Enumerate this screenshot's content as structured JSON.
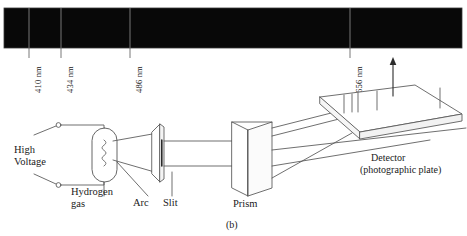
{
  "figure": {
    "id": "(b)"
  },
  "spectrum": {
    "name": "hydrogen-emission-spectrum",
    "background_color": "#080808",
    "line_color": "#6e6e6e",
    "box": {
      "x": 4,
      "y": 8,
      "width": 458,
      "height": 40
    },
    "lines": [
      {
        "label": "410 nm",
        "wavelength_nm": 410,
        "x": 29
      },
      {
        "label": "434 nm",
        "wavelength_nm": 434,
        "x": 61
      },
      {
        "label": "486 nm",
        "wavelength_nm": 486,
        "x": 130
      },
      {
        "label": "656 nm",
        "wavelength_nm": 656,
        "x": 350
      }
    ]
  },
  "apparatus": {
    "name": "spectrometer-diagram",
    "parts": {
      "high_voltage": "High\nVoltage",
      "hydrogen_gas": "Hydrogen\ngas",
      "arc": "Arc",
      "slit": "Slit",
      "prism": "Prism",
      "detector_line1": "Detector",
      "detector_line2": "(photographic plate)"
    }
  },
  "colors": {
    "ink": "#1a1a1a",
    "stroke": "#5a5a5a",
    "spectrum_fill": "#080808"
  }
}
